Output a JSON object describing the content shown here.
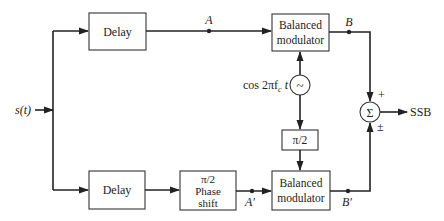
{
  "diagram": {
    "type": "block-diagram",
    "title": "",
    "input": {
      "label": "s(t)"
    },
    "output": {
      "label": "SSB"
    },
    "blocks": [
      {
        "id": "delay_top",
        "label": "Delay"
      },
      {
        "id": "bm_top",
        "lines": [
          "Balanced",
          "modulator"
        ]
      },
      {
        "id": "oscillator",
        "symbol": "~",
        "label": "cos 2πf",
        "sub": "c",
        "suffix": " t"
      },
      {
        "id": "phase90_carrier",
        "label": "π/2"
      },
      {
        "id": "delay_bottom",
        "label": "Delay"
      },
      {
        "id": "phase_shift",
        "lines": [
          "π/2",
          "Phase",
          "shift"
        ]
      },
      {
        "id": "bm_bottom",
        "lines": [
          "Balanced",
          "modulator"
        ]
      },
      {
        "id": "summer",
        "symbol": "Σ",
        "plus_label": "+",
        "pm_label": "±"
      }
    ],
    "nodes": {
      "A": "A",
      "B": "B",
      "A_prime": "A′",
      "B_prime": "B′"
    },
    "connections": [
      {
        "from": "s(t)",
        "to": "delay_top"
      },
      {
        "from": "s(t)",
        "to": "delay_bottom"
      },
      {
        "from": "delay_top",
        "to": "bm_top",
        "via": "A"
      },
      {
        "from": "oscillator",
        "to": "bm_top"
      },
      {
        "from": "oscillator",
        "to": "phase90_carrier"
      },
      {
        "from": "phase90_carrier",
        "to": "bm_bottom"
      },
      {
        "from": "delay_bottom",
        "to": "phase_shift"
      },
      {
        "from": "phase_shift",
        "to": "bm_bottom",
        "via": "A′"
      },
      {
        "from": "bm_top",
        "to": "summer",
        "via": "B",
        "sign": "+"
      },
      {
        "from": "bm_bottom",
        "to": "summer",
        "via": "B′",
        "sign": "±"
      },
      {
        "from": "summer",
        "to": "SSB"
      }
    ]
  }
}
